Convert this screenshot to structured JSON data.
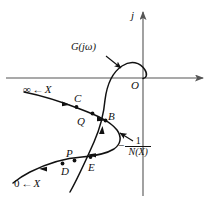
{
  "figure": {
    "type": "nyquist-describing-function-plot",
    "axes": {
      "imaginary_axis_label": "j",
      "origin_label": "O",
      "real_axis": {
        "direction": "right",
        "has_arrow": true
      },
      "imag_axis": {
        "direction": "up",
        "has_arrow": true
      }
    },
    "curves": {
      "g_jw": {
        "label": "G(jω)",
        "description": "Nyquist plot of open loop transfer function G(jw)"
      },
      "neg_inv_n": {
        "label_minus": "−",
        "label_numerator": "1",
        "label_denominator": "N(X)",
        "description": "negative inverse describing function locus -1/N(X)"
      }
    },
    "branch_labels": [
      {
        "name": "upper-branch",
        "limit": "∞",
        "arrow": "←",
        "variable": "X"
      },
      {
        "name": "lower-branch",
        "limit": "0",
        "arrow": "←",
        "variable": "X"
      }
    ],
    "points": [
      {
        "id": "C",
        "label": "C"
      },
      {
        "id": "Q",
        "label": "Q"
      },
      {
        "id": "B",
        "label": "B"
      },
      {
        "id": "P",
        "label": "P"
      },
      {
        "id": "D",
        "label": "D"
      },
      {
        "id": "E",
        "label": "E"
      },
      {
        "id": "O",
        "label": "O"
      }
    ],
    "colors": {
      "axis": "#555555",
      "curve": "#111111",
      "text": "#111111",
      "background": "#ffffff"
    }
  }
}
